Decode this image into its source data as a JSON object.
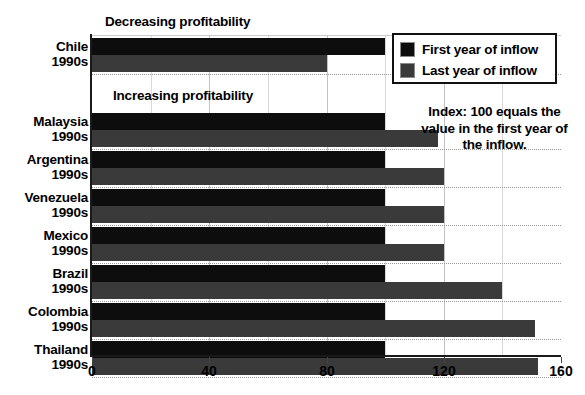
{
  "chart_data": {
    "type": "bar",
    "orientation": "horizontal",
    "title": "",
    "xlabel": "",
    "ylabel": "",
    "xlim": [
      0,
      160
    ],
    "xticks": [
      0,
      40,
      80,
      120,
      160
    ],
    "xtick_labels": [
      "0",
      "40",
      "80",
      "120",
      "160"
    ],
    "gridlines": [
      20,
      40,
      60,
      80,
      100,
      120,
      140
    ],
    "grid": true,
    "legend_position": "top-right",
    "categories": [
      "Chile 1990s",
      "Malaysia 1990s",
      "Argentina 1990s",
      "Venezuela 1990s",
      "Mexico 1990s",
      "Brazil 1990s",
      "Colombia 1990s",
      "Thailand 1990s"
    ],
    "series": [
      {
        "name": "First year of inflow",
        "color": "#0d0d0d",
        "values": [
          100,
          100,
          100,
          100,
          100,
          100,
          100,
          100
        ]
      },
      {
        "name": "Last year of inflow",
        "color": "#3a3a3a",
        "values": [
          80,
          118,
          120,
          120,
          120,
          140,
          151,
          152
        ]
      }
    ],
    "annotations": [
      "Decreasing profitability",
      "Increasing profitability",
      "Index: 100 equals the value in the first year of the inflow."
    ]
  },
  "rows": [
    {
      "country": "Chile",
      "period": "1990s",
      "first": 100,
      "last": 80,
      "top": 38,
      "group": "decreasing"
    },
    {
      "country": "Malaysia",
      "period": "1990s",
      "first": 100,
      "last": 118,
      "top": 113,
      "group": "increasing"
    },
    {
      "country": "Argentina",
      "period": "1990s",
      "first": 100,
      "last": 120,
      "top": 151,
      "group": "increasing"
    },
    {
      "country": "Venezuela",
      "period": "1990s",
      "first": 100,
      "last": 120,
      "top": 189,
      "group": "increasing"
    },
    {
      "country": "Mexico",
      "period": "1990s",
      "first": 100,
      "last": 120,
      "top": 227,
      "group": "increasing"
    },
    {
      "country": "Brazil",
      "period": "1990s",
      "first": 100,
      "last": 140,
      "top": 265,
      "group": "increasing"
    },
    {
      "country": "Colombia",
      "period": "1990s",
      "first": 100,
      "last": 151,
      "top": 303,
      "group": "increasing"
    },
    {
      "country": "Thailand",
      "period": "1990s",
      "first": 100,
      "last": 152,
      "top": 341,
      "group": "increasing"
    }
  ],
  "legend": {
    "items": [
      {
        "label": "First year of inflow",
        "color": "#0d0d0d"
      },
      {
        "label": "Last year of inflow",
        "color": "#3a3a3a"
      }
    ]
  },
  "annotations": {
    "decreasing": "Decreasing profitability",
    "increasing": "Increasing profitability",
    "index_note": "Index: 100 equals the value in the first year of the inflow."
  },
  "axis": {
    "ticks": [
      {
        "value": 0,
        "label": "0"
      },
      {
        "value": 40,
        "label": "40"
      },
      {
        "value": 80,
        "label": "80"
      },
      {
        "value": 120,
        "label": "120"
      },
      {
        "value": 160,
        "label": "160"
      }
    ],
    "min": 0,
    "max": 160
  },
  "colors": {
    "first_year": "#0d0d0d",
    "last_year": "#3a3a3a",
    "axis": "#1a1a1a",
    "grid": "#c2c2c2",
    "background": "#ffffff"
  }
}
